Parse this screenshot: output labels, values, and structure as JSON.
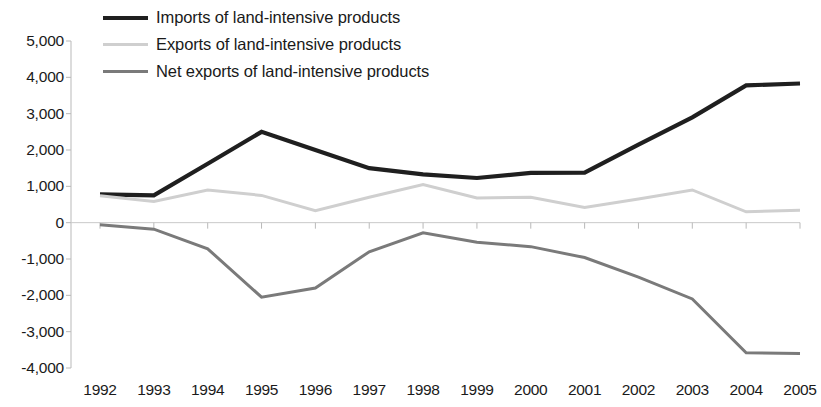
{
  "legend": {
    "position": "top-left",
    "items": [
      {
        "label": "Imports of land-intensive products",
        "key": "imports",
        "color": "#1f1f1f",
        "width": 4
      },
      {
        "label": "Exports of land-intensive products",
        "key": "exports",
        "color": "#cfcfcf",
        "width": 3
      },
      {
        "label": "Net exports of land-intensive products",
        "key": "net_exports",
        "color": "#7a7a7a",
        "width": 3
      }
    ]
  },
  "axes": {
    "y_ticks": [
      "5,000",
      "4,000",
      "3,000",
      "2,000",
      "1,000",
      "0",
      "-1,000",
      "-2,000",
      "-3,000",
      "-4,000"
    ],
    "y_tick_values": [
      5000,
      4000,
      3000,
      2000,
      1000,
      0,
      -1000,
      -2000,
      -3000,
      -4000
    ],
    "x_ticks": [
      "1992",
      "1993",
      "1994",
      "1995",
      "1996",
      "1997",
      "1998",
      "1999",
      "2000",
      "2001",
      "2002",
      "2003",
      "2004",
      "2005"
    ]
  },
  "chart_data": {
    "type": "line",
    "title": "",
    "subtitle": "",
    "xlabel": "",
    "ylabel": "",
    "grid": false,
    "legend_position": "top-left",
    "ylim": [
      -4000,
      5000
    ],
    "ytick_step": 1000,
    "categories": [
      "1992",
      "1993",
      "1994",
      "1995",
      "1996",
      "1997",
      "1998",
      "1999",
      "2000",
      "2001",
      "2002",
      "2003",
      "2004",
      "2005"
    ],
    "series": [
      {
        "name": "Imports of land-intensive products",
        "color": "#1f1f1f",
        "values": [
          780,
          750,
          1620,
          2500,
          2000,
          1500,
          1330,
          1230,
          1370,
          1380,
          2150,
          2900,
          3780,
          3830
        ]
      },
      {
        "name": "Exports of land-intensive products",
        "color": "#cfcfcf",
        "values": [
          740,
          580,
          900,
          750,
          330,
          700,
          1050,
          680,
          700,
          420,
          650,
          900,
          300,
          340
        ]
      },
      {
        "name": "Net exports of land-intensive products",
        "color": "#7a7a7a",
        "values": [
          -60,
          -180,
          -720,
          -2050,
          -1800,
          -800,
          -280,
          -540,
          -660,
          -960,
          -1500,
          -2100,
          -3580,
          -3600
        ]
      }
    ]
  }
}
